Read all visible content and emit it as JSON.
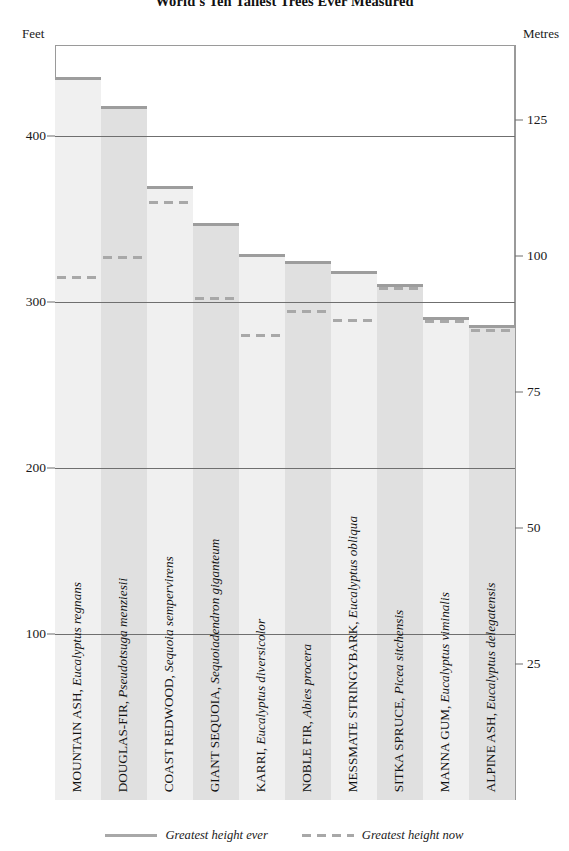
{
  "title": "World's Ten Tallest Trees Ever Measured",
  "axis_caption_left": "Feet",
  "axis_caption_right": "Metres",
  "legend": {
    "ever_label": "Greatest height ever",
    "now_label": "Greatest height now"
  },
  "colors": {
    "bar_fill_light": "#f0f0f0",
    "bar_fill_dark": "#e0e0e0",
    "bar_cap": "#9d9d9d",
    "dash": "#a8a8a8",
    "gridline": "#6f6f6f",
    "frame": "#9a9a9a",
    "text": "#1a1a1a"
  },
  "chart_data": {
    "type": "bar",
    "title": "World's Ten Tallest Trees Ever Measured",
    "xlabel": "",
    "ylabel": "Feet",
    "ylabel_secondary": "Metres",
    "ylim": [
      0,
      455
    ],
    "ylim_secondary": [
      0,
      138.7
    ],
    "grid": true,
    "legend_position": "bottom-center",
    "yticks": [
      100,
      200,
      300,
      400
    ],
    "ytick_labels": [
      "100",
      "200",
      "300",
      "400"
    ],
    "yticks_secondary": [
      25,
      50,
      75,
      100,
      125
    ],
    "ytick_labels_secondary": [
      "25",
      "50",
      "75",
      "100",
      "125"
    ],
    "categories": [
      "MOUNTAIN ASH, Eucalyptus regnans",
      "DOUGLAS-FIR, Pseudotsuga menziesii",
      "COAST REDWOOD, Sequoia sempervirens",
      "GIANT SEQUOIA, Sequoiadendron giganteum",
      "KARRI, Eucalyptus diversicolor",
      "NOBLE FIR, Abies procera",
      "MESSMATE STRINGYBARK, Eucalyptus obliqua",
      "SITKA SPRUCE, Picea sitchensis",
      "MANNA GUM, Eucalyptus viminalis",
      "ALPINE ASH, Eucalyptus delegatensis"
    ],
    "series": [
      {
        "name": "Greatest height ever",
        "style": "solid",
        "values": [
          436,
          418,
          370,
          348,
          329,
          325,
          319,
          311,
          291,
          286
        ]
      },
      {
        "name": "Greatest height now",
        "style": "dashed",
        "values": [
          316,
          328,
          361,
          303,
          281,
          295,
          290,
          309,
          289,
          284
        ]
      }
    ]
  },
  "bars": [
    {
      "common": "MOUNTAIN ASH, ",
      "sci": "Eucalyptus regnans",
      "ever": 436,
      "now": 316
    },
    {
      "common": "DOUGLAS-FIR, ",
      "sci": "Pseudotsuga menziesii",
      "ever": 418,
      "now": 328
    },
    {
      "common": "COAST REDWOOD, ",
      "sci": "Sequoia sempervirens",
      "ever": 370,
      "now": 361
    },
    {
      "common": "GIANT SEQUOIA, ",
      "sci": "Sequoiadendron giganteum",
      "ever": 348,
      "now": 303
    },
    {
      "common": "KARRI, ",
      "sci": "Eucalyptus diversicolor",
      "ever": 329,
      "now": 281
    },
    {
      "common": "NOBLE FIR, ",
      "sci": "Abies procera",
      "ever": 325,
      "now": 295
    },
    {
      "common": "MESSMATE STRINGYBARK, ",
      "sci": "Eucalyptus obliqua",
      "ever": 319,
      "now": 290
    },
    {
      "common": "SITKA SPRUCE, ",
      "sci": "Picea sitchensis",
      "ever": 311,
      "now": 309
    },
    {
      "common": "MANNA GUM, ",
      "sci": "Eucalyptus viminalis",
      "ever": 291,
      "now": 289
    },
    {
      "common": "ALPINE ASH, ",
      "sci": "Eucalyptus delegatensis",
      "ever": 286,
      "now": 284
    }
  ]
}
